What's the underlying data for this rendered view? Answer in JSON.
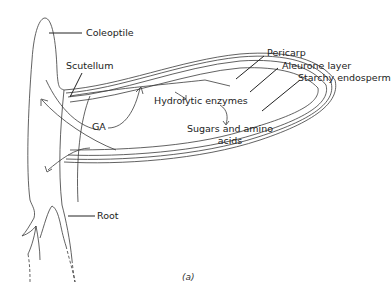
{
  "diagram": {
    "labels": {
      "coleoptile": "Coleoptile",
      "scutellum": "Scutellum",
      "ga": "GA",
      "hydrolytic_enzymes": "Hydrolytic enzymes",
      "sugars_line1": "Sugars and amino",
      "sugars_line2": "acids",
      "pericarp": "Pericarp",
      "aleurone_layer": "Aleurone layer",
      "starchy_endosperm": "Starchy endosperm",
      "root": "Root"
    },
    "caption": "(a)",
    "colors": {
      "line": "#3a3a3a",
      "text": "#222222",
      "background": "#ffffff"
    }
  }
}
